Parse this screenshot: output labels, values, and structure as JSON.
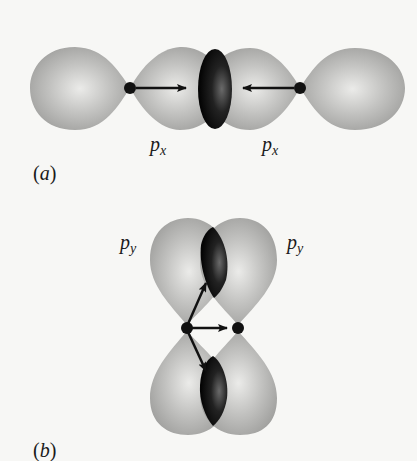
{
  "figure": {
    "panels": [
      {
        "id": "a",
        "panel_label": "a",
        "description": "Sigma bond formed by head-on overlap of two px orbitals",
        "orbital_labels": [
          {
            "main": "p",
            "subscript": "x"
          },
          {
            "main": "p",
            "subscript": "x"
          }
        ],
        "arrows": [
          "right",
          "left"
        ]
      },
      {
        "id": "b",
        "panel_label": "b",
        "description": "Pi bond formed by side-by-side overlap of two py orbitals",
        "orbital_labels": [
          {
            "main": "p",
            "subscript": "y"
          },
          {
            "main": "p",
            "subscript": "y"
          }
        ],
        "arrows": [
          "up-right",
          "right",
          "down-right"
        ]
      }
    ],
    "colors": {
      "background": "#f7f7f5",
      "lobe_light": "#e8e8e6",
      "lobe_mid": "#b3b3b1",
      "lobe_edge": "#9a9a98",
      "overlap_dark": "#111111",
      "nucleus": "#111111",
      "arrow": "#111111"
    }
  }
}
